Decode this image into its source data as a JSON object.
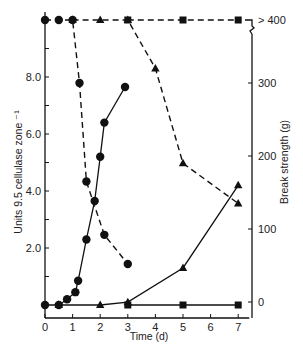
{
  "chart_data": {
    "type": "line",
    "title": "",
    "xlabel": "Time (d)",
    "ylabel": "Units 9.5 cellulase zone ⁻¹",
    "y2label": "Break strength (g)",
    "x_ticks": [
      0,
      1,
      2,
      3,
      4,
      5,
      6,
      7
    ],
    "xlim": [
      0,
      7.4
    ],
    "y_ticks": [
      "2.0",
      "4.0",
      "6.0",
      "8.0"
    ],
    "y_minor_ticks": [
      1,
      3,
      5,
      7,
      9
    ],
    "ylim": [
      0,
      10
    ],
    "y2_ticks": [
      "0",
      "100",
      "200",
      "300",
      "> 400"
    ],
    "y2lim": [
      0,
      400
    ],
    "y2_break": true,
    "grid": false,
    "legend": "none",
    "series": [
      {
        "name": "Cellulase activity (circles, solid)",
        "axis": "left",
        "marker": "circle",
        "line": "solid",
        "x": [
          0,
          0.5,
          0.8,
          1.1,
          1.2,
          1.5,
          1.8,
          2.0,
          2.15,
          2.9
        ],
        "y": [
          0,
          0,
          0.2,
          0.45,
          0.85,
          2.3,
          3.65,
          5.2,
          6.4,
          7.65
        ]
      },
      {
        "name": "Break strength (circles, dashed)",
        "axis": "right",
        "marker": "circle",
        "line": "dashed",
        "x": [
          0,
          0.5,
          1.0,
          1.25,
          1.5,
          2.15,
          3.0
        ],
        "y": [
          ">400",
          ">400",
          ">400",
          300,
          165,
          92,
          52
        ]
      },
      {
        "name": "Cellulase activity (triangles, solid)",
        "axis": "left",
        "marker": "triangle",
        "line": "solid",
        "x": [
          0.5,
          2,
          3,
          5,
          7
        ],
        "y": [
          0,
          0,
          0.1,
          1.3,
          4.2
        ]
      },
      {
        "name": "Break strength (triangles, dashed)",
        "axis": "right",
        "marker": "triangle",
        "line": "dashed",
        "x": [
          1.0,
          2,
          3,
          4,
          5,
          7
        ],
        "y": [
          ">400",
          ">400",
          ">400",
          320,
          190,
          135
        ]
      },
      {
        "name": "Cellulase activity (squares, solid)",
        "axis": "left",
        "marker": "square",
        "line": "solid",
        "x": [
          3,
          5,
          7
        ],
        "y": [
          0,
          0,
          0
        ]
      },
      {
        "name": "Break strength (squares, dashed)",
        "axis": "right",
        "marker": "square",
        "line": "dashed",
        "x": [
          3,
          5,
          7
        ],
        "y": [
          ">400",
          ">400",
          ">400"
        ]
      }
    ]
  },
  "layout_px": {
    "x0": 45,
    "xPerDay": 27.6,
    "yBase": 305,
    "yPerUnit": 28.5,
    "y2Base": 302,
    "y2Per100": 73,
    "yTop": 20,
    "rightAxisX": 252
  }
}
